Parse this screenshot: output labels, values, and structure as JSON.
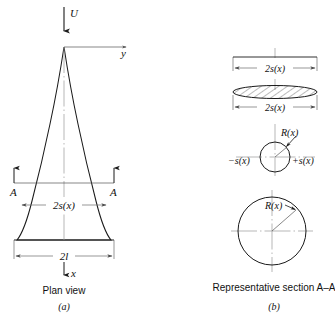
{
  "figure": {
    "title_implicit": "Slender pointed planar body and its representative circular cross-section",
    "panels": [
      {
        "id": "a",
        "label": "(a)",
        "caption": "Plan view",
        "flow_arrow_label": "U",
        "axis_labels": {
          "spanwise": "y",
          "streamwise": "x"
        },
        "section_markers": {
          "left": "A",
          "right": "A"
        },
        "dimensions": [
          {
            "name": "local-semispan",
            "label": "2s(x)"
          },
          {
            "name": "root-chord-span",
            "label": "2l"
          }
        ]
      },
      {
        "id": "b",
        "label": "(b)",
        "caption": "Representative section A–A",
        "items": [
          {
            "name": "top-width-dimension",
            "label": "2s(x)"
          },
          {
            "name": "ellipse-width-dimension",
            "label": "2s(x)"
          },
          {
            "name": "small-circle-radius",
            "label": "R(x)"
          },
          {
            "name": "small-circle-left-edge",
            "label": "−s(x)"
          },
          {
            "name": "small-circle-right-edge",
            "label": "+s(x)"
          },
          {
            "name": "large-circle-radius",
            "label": "R(x)"
          }
        ]
      }
    ],
    "colors": {
      "ink": "#1a1a1a",
      "dimension_line": "#6b6b6b",
      "centerline": "#9a9a9a",
      "background": "#ffffff"
    }
  }
}
